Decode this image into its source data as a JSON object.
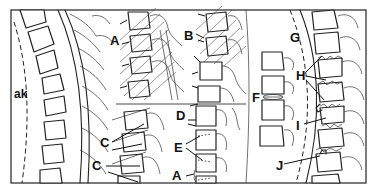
{
  "figure": {
    "panels": [
      {
        "id": "left",
        "content": "Normal spine column with dashed anterior line",
        "labels": [
          "ak"
        ]
      },
      {
        "id": "top-middle",
        "content": "Hatched vertebrae with arrows",
        "labels": [
          "A",
          "B"
        ]
      },
      {
        "id": "bottom-middle",
        "content": "Vertebrae with arrows and dotted lines",
        "labels": [
          "C",
          "C",
          "D",
          "E",
          "A"
        ]
      },
      {
        "id": "right",
        "content": "Vertebrae with disc lesion, dashed line and irregular endplates",
        "labels": [
          "F",
          "G",
          "H",
          "I",
          "J"
        ]
      }
    ],
    "labels": {
      "ak": "ak",
      "A_top": "A",
      "B": "B",
      "C1": "C",
      "C2": "C",
      "D": "D",
      "E": "E",
      "A_bottom": "A",
      "F": "F",
      "G": "G",
      "H": "H",
      "I": "I",
      "J": "J"
    },
    "colors": {
      "line": "#222222",
      "background": "#ffffff"
    }
  }
}
